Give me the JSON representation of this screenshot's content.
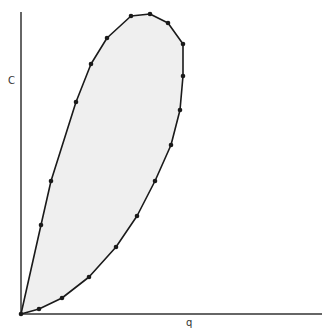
{
  "chart_data": {
    "type": "area",
    "title": "",
    "xlabel": "q",
    "ylabel": "C",
    "grid": false,
    "legend": null,
    "boundary_points_px": [
      [
        21,
        314
      ],
      [
        39,
        309
      ],
      [
        62,
        298
      ],
      [
        89,
        277
      ],
      [
        116,
        247
      ],
      [
        137,
        216
      ],
      [
        155,
        181
      ],
      [
        171,
        145
      ],
      [
        180,
        110
      ],
      [
        183,
        76
      ],
      [
        183,
        44
      ],
      [
        168,
        23
      ],
      [
        150,
        14
      ],
      [
        131,
        16
      ],
      [
        107,
        38
      ],
      [
        91,
        64
      ],
      [
        76,
        102
      ],
      [
        51,
        181
      ],
      [
        41,
        225
      ]
    ],
    "fill_color": "#efefef",
    "stroke_color": "#1a1a1a"
  },
  "axes": {
    "x_label": "q",
    "y_label": "C"
  }
}
